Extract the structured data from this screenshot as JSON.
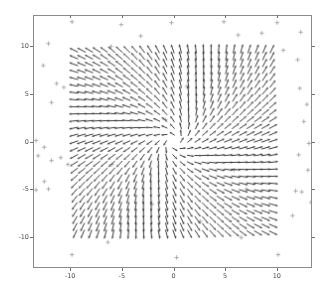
{
  "figure": {
    "background_color": "#ffffff",
    "width": 328,
    "height": 294
  },
  "axes": {
    "spine_color": "#8a8a8a",
    "tick_color": "#6f6f6f",
    "tick_label_color": "#4d4d4d",
    "left_px": 33,
    "top_px": 15,
    "width_px": 279,
    "height_px": 253,
    "title": "",
    "xlabel": "",
    "ylabel": ""
  },
  "chart_data": {
    "type": "scatter",
    "subtype": "quiver-vector-field-with-scatter",
    "title": "",
    "xlabel": "",
    "ylabel": "",
    "xlim": [
      -13.6,
      13.4
    ],
    "ylim": [
      -13.2,
      13.2
    ],
    "xticks": [
      -10,
      -5,
      0,
      5,
      10
    ],
    "xticklabels": [
      "-10",
      "-5",
      "0",
      "5",
      "10"
    ],
    "yticks": [
      -10,
      -5,
      0,
      5,
      10
    ],
    "yticklabels": [
      "-10",
      "-5",
      "0",
      "5",
      "10"
    ],
    "grid": false,
    "legend": null,
    "quiver": {
      "color": "#1a1a1a",
      "grid_min": -9.5,
      "grid_max": 9.5,
      "grid_count": 27,
      "arrow_scale_px": 6.2,
      "head_len_px": 2.6,
      "singularity": [
        0.0,
        0.0
      ],
      "field_description": "radial outflow with rotational shear; vectors point away from origin, magnitude normalized",
      "formula": {
        "u": "x/r * (1 - exp(-r/3)) - 0.35*y/r",
        "v": "y/r * (1 - exp(-r/3)) + 0.35*x/r"
      }
    },
    "scatter": {
      "marker": "+",
      "color": "#9a9a9a",
      "size_px": 4.4,
      "linewidth_px": 0.8,
      "points": [
        [
          -9.9,
          12.6
        ],
        [
          -5.1,
          12.3
        ],
        [
          -0.2,
          12.5
        ],
        [
          4.9,
          12.6
        ],
        [
          10.1,
          12.5
        ],
        [
          -12.2,
          10.3
        ],
        [
          -12.7,
          8.0
        ],
        [
          6.3,
          11.2
        ],
        [
          8.6,
          11.4
        ],
        [
          12.4,
          11.5
        ],
        [
          -11.4,
          6.1
        ],
        [
          -10.7,
          5.7
        ],
        [
          -11.9,
          4.1
        ],
        [
          -6.1,
          10.0
        ],
        [
          -3.2,
          11.1
        ],
        [
          10.7,
          9.6
        ],
        [
          12.1,
          8.6
        ],
        [
          12.3,
          5.6
        ],
        [
          13.0,
          3.9
        ],
        [
          12.7,
          2.1
        ],
        [
          -13.4,
          0.1
        ],
        [
          -12.6,
          -0.6
        ],
        [
          -13.2,
          -1.5
        ],
        [
          13.2,
          -0.2
        ],
        [
          12.2,
          -1.4
        ],
        [
          -11.9,
          -2.0
        ],
        [
          -11.0,
          -1.7
        ],
        [
          -10.3,
          -2.4
        ],
        [
          13.1,
          -3.0
        ],
        [
          -12.6,
          -4.2
        ],
        [
          -13.4,
          -5.1
        ],
        [
          -12.2,
          -5.0
        ],
        [
          11.9,
          -5.2
        ],
        [
          12.5,
          -5.3
        ],
        [
          -6.0,
          -2.4
        ],
        [
          5.9,
          -3.0
        ],
        [
          7.1,
          -5.0
        ],
        [
          13.4,
          -6.4
        ],
        [
          -0.8,
          2.3
        ],
        [
          1.3,
          5.8
        ],
        [
          -2.1,
          -6.6
        ],
        [
          2.6,
          -8.4
        ],
        [
          11.6,
          -7.8
        ],
        [
          -9.9,
          -11.9
        ],
        [
          0.3,
          -12.2
        ],
        [
          10.2,
          -11.9
        ],
        [
          -6.4,
          -10.6
        ],
        [
          6.6,
          -10.1
        ]
      ]
    }
  }
}
